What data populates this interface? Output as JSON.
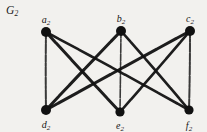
{
  "figure": {
    "title": "G",
    "title_subscript": "2",
    "background_color": "#f2f1ee",
    "ink_color": "#111111",
    "width": 207,
    "height": 132
  },
  "vertices": [
    {
      "id": "a2",
      "base": "a",
      "sub": "2",
      "x": 46,
      "y": 32,
      "label_x": 46,
      "label_y": 15,
      "r": 5.0,
      "row": "top"
    },
    {
      "id": "b2",
      "base": "b",
      "sub": "2",
      "x": 121,
      "y": 31,
      "label_x": 121,
      "label_y": 14,
      "r": 5.0,
      "row": "top"
    },
    {
      "id": "c2",
      "base": "c",
      "sub": "2",
      "x": 190,
      "y": 31,
      "label_x": 190,
      "label_y": 14,
      "r": 5.0,
      "row": "top"
    },
    {
      "id": "d2",
      "base": "d",
      "sub": "2",
      "x": 46,
      "y": 110,
      "label_x": 46,
      "label_y": 120,
      "r": 5.0,
      "row": "bottom"
    },
    {
      "id": "e2",
      "base": "e",
      "sub": "2",
      "x": 120,
      "y": 112,
      "label_x": 120,
      "label_y": 121,
      "r": 4.6,
      "row": "bottom"
    },
    {
      "id": "f2",
      "base": "f",
      "sub": "2",
      "x": 189,
      "y": 110,
      "label_x": 189,
      "label_y": 121,
      "r": 4.6,
      "row": "bottom"
    }
  ],
  "edges": [
    {
      "from": "a2",
      "to": "d2",
      "style": "thin",
      "width": 2.0
    },
    {
      "from": "a2",
      "to": "e2",
      "style": "thick",
      "width": 3.0
    },
    {
      "from": "a2",
      "to": "f2",
      "style": "thick",
      "width": 2.6
    },
    {
      "from": "b2",
      "to": "d2",
      "style": "thick",
      "width": 3.0
    },
    {
      "from": "b2",
      "to": "e2",
      "style": "thin",
      "width": 1.6
    },
    {
      "from": "b2",
      "to": "f2",
      "style": "thick",
      "width": 2.6
    },
    {
      "from": "c2",
      "to": "d2",
      "style": "thick",
      "width": 3.0
    },
    {
      "from": "c2",
      "to": "e2",
      "style": "thick",
      "width": 2.6
    },
    {
      "from": "c2",
      "to": "f2",
      "style": "thin",
      "width": 2.0
    }
  ],
  "graph_meta": {
    "type": "complete-bipartite",
    "name": "K3,3",
    "vertex_count": 6,
    "edge_count": 9
  }
}
